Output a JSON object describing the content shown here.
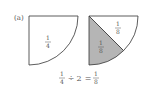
{
  "label": "(a)",
  "left_sector": {
    "fraction": {
      "num": "1",
      "den": "4"
    },
    "fill": "#ffffff"
  },
  "right_sector": {
    "shaded": {
      "fraction": {
        "num": "1",
        "den": "8"
      },
      "fill": "#b5b5b5"
    },
    "unshaded": {
      "fraction": {
        "num": "1",
        "den": "8"
      },
      "fill": "#ffffff"
    }
  },
  "equation": {
    "left": {
      "num": "1",
      "den": "4"
    },
    "operator": "÷",
    "divisor": "2",
    "equals": "=",
    "result": {
      "num": "1",
      "den": "8"
    }
  },
  "colors": {
    "stroke": "#333333",
    "text": "#555555"
  }
}
